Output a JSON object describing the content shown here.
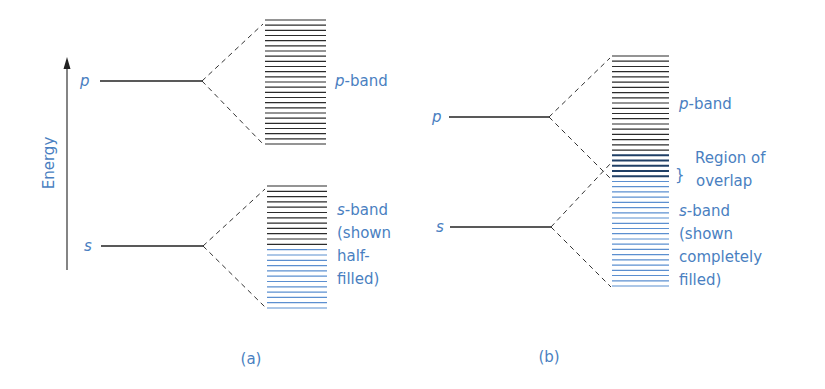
{
  "colors": {
    "label_blue": "#4a7fc1",
    "line_black": "#2b2b2b",
    "filled_blue": "#5b8fd0",
    "overlap_dark": "#1f3f66"
  },
  "axis": {
    "label": "Energy"
  },
  "panel_a": {
    "caption": "(a)",
    "levels": {
      "p": "p",
      "s": "s"
    },
    "p_band": {
      "letter": "p",
      "suffix": "-band"
    },
    "s_band": {
      "letter": "s",
      "suffix": "-band",
      "note_lines": [
        "(shown",
        "half-",
        "filled)"
      ]
    }
  },
  "panel_b": {
    "caption": "(b)",
    "levels": {
      "p": "p",
      "s": "s"
    },
    "p_band": {
      "letter": "p",
      "suffix": "-band"
    },
    "overlap": {
      "brace": "}",
      "lines": [
        "Region of",
        "overlap"
      ]
    },
    "s_band": {
      "letter": "s",
      "suffix": "-band",
      "note_lines": [
        "(shown",
        "completely",
        "filled)"
      ]
    }
  }
}
